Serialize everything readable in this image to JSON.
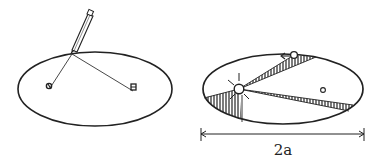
{
  "figure": {
    "panels": [
      {
        "id": "string-construction",
        "description": "Ellipse drawn with a pencil and a string looped around two pins at the foci",
        "elements": [
          "ellipse",
          "pencil",
          "string",
          "pin-left-focus",
          "pin-right-focus"
        ]
      },
      {
        "id": "kepler-orbit",
        "description": "Elliptical orbit with the Sun at one focus, planet moving counter-clockwise, two shaded equal-area sectors",
        "elements": [
          "ellipse",
          "sun",
          "planet",
          "empty-focus",
          "shaded-sector-perihelion",
          "shaded-sector-aphelion",
          "direction-arrow",
          "major-axis-dimension"
        ],
        "major_axis_label": "2a"
      }
    ]
  },
  "colors": {
    "ink": "#222222",
    "background": "#ffffff"
  }
}
